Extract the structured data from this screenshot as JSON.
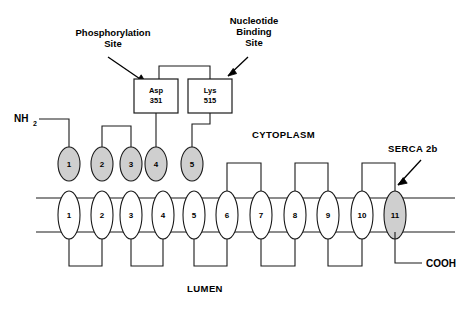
{
  "figure": {
    "title_text": "SERCA 2b membrane topology diagram",
    "regions": {
      "cytoplasm": "CYTOPLASM",
      "lumen": "LUMEN"
    },
    "termini": {
      "n_terminus": "NH",
      "n_terminus_sub": "2",
      "c_terminus": "COOH"
    },
    "annotations": [
      {
        "id": "phosphorylation-site",
        "line1": "Phosphorylation",
        "line2": "Site"
      },
      {
        "id": "nucleotide-binding-site",
        "line1": "Nucleotide",
        "line2": "Binding",
        "line3": "Site"
      },
      {
        "id": "protein-name",
        "line1": "SERCA 2b"
      }
    ],
    "domain_boxes": [
      {
        "id": "asp-351",
        "residue": "Asp",
        "number": "351"
      },
      {
        "id": "lys-515",
        "residue": "Lys",
        "number": "515"
      }
    ],
    "cytoplasmic_helices": [
      {
        "label": "1",
        "shaded": true
      },
      {
        "label": "2",
        "shaded": true
      },
      {
        "label": "3",
        "shaded": true
      },
      {
        "label": "4",
        "shaded": true
      },
      {
        "label": "5",
        "shaded": true
      }
    ],
    "transmembrane_helices": [
      {
        "label": "1",
        "shaded": false
      },
      {
        "label": "2",
        "shaded": false
      },
      {
        "label": "3",
        "shaded": false
      },
      {
        "label": "4",
        "shaded": false
      },
      {
        "label": "5",
        "shaded": false
      },
      {
        "label": "6",
        "shaded": false
      },
      {
        "label": "7",
        "shaded": false
      },
      {
        "label": "8",
        "shaded": false
      },
      {
        "label": "9",
        "shaded": false
      },
      {
        "label": "10",
        "shaded": false
      },
      {
        "label": "11",
        "shaded": true
      }
    ],
    "colors": {
      "shaded_fill": "#cfcfcf",
      "open_fill": "#ffffff",
      "stroke": "#1a1a1a",
      "background": "#ffffff"
    }
  }
}
